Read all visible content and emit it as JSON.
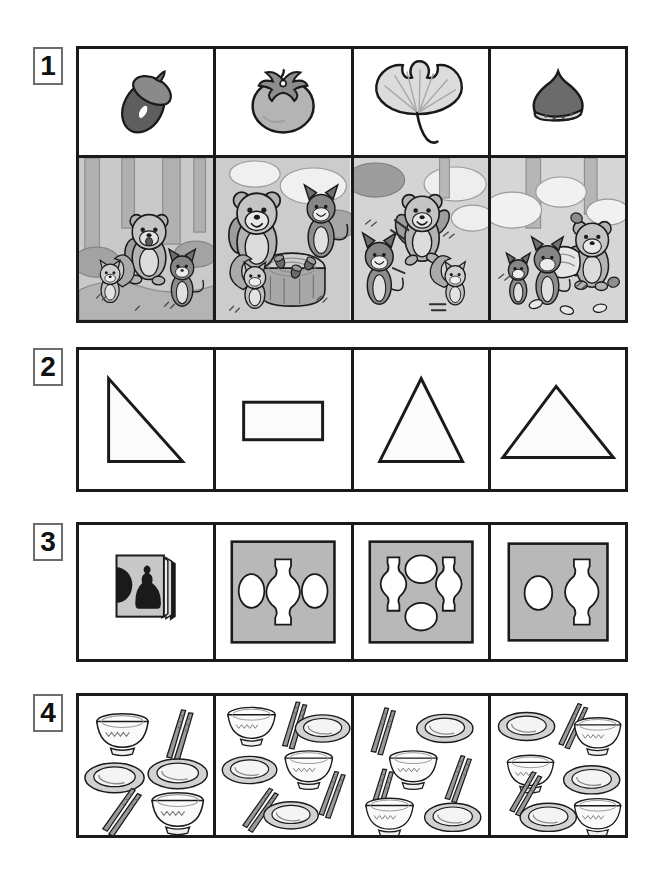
{
  "page": {
    "background": "#ffffff",
    "ink": "#1a1a1a",
    "gray_fill": "#b8b8b8",
    "light_fill": "#d8d8d8",
    "scene_bg": "#c9c9c9"
  },
  "rows": [
    {
      "number": "1",
      "name": "autumn-nature-and-forest-scenes",
      "top_cells": [
        {
          "name": "acorn",
          "label": "acorn",
          "icon": "acorn-icon"
        },
        {
          "name": "persimmon",
          "label": "persimmon",
          "icon": "persimmon-icon"
        },
        {
          "name": "ginkgo-leaf",
          "label": "ginkgo leaf",
          "icon": "ginkgo-leaf-icon"
        },
        {
          "name": "chestnut",
          "label": "chestnut",
          "icon": "chestnut-icon"
        }
      ],
      "bottom_cells": [
        {
          "name": "scene-walking-in-forest",
          "label": "bear, squirrel and cat walking in the forest",
          "animals": [
            "bear",
            "squirrel",
            "cat"
          ]
        },
        {
          "name": "scene-acorns-on-stump",
          "label": "bear, cat and squirrel around a tree stump with acorns",
          "animals": [
            "bear",
            "cat",
            "squirrel"
          ]
        },
        {
          "name": "scene-running-together",
          "label": "bear, cat and squirrel running",
          "animals": [
            "bear",
            "cat",
            "squirrel"
          ]
        },
        {
          "name": "scene-going-home",
          "label": "bear and cats heading home",
          "animals": [
            "cat",
            "cat",
            "bear"
          ]
        }
      ]
    },
    {
      "number": "2",
      "name": "shapes-row",
      "cells": [
        {
          "name": "right-triangle",
          "label": "right triangle",
          "shape": "right-triangle"
        },
        {
          "name": "rectangle",
          "label": "rectangle",
          "shape": "rectangle"
        },
        {
          "name": "tall-triangle",
          "label": "tall isosceles triangle",
          "shape": "tall-triangle"
        },
        {
          "name": "wide-triangle",
          "label": "wide isosceles triangle",
          "shape": "wide-triangle"
        }
      ]
    },
    {
      "number": "3",
      "name": "figure-ground-illusion-row",
      "cells": [
        {
          "name": "illusion-book",
          "label": "book showing face and vase illusion",
          "vases": 0,
          "faces": 0
        },
        {
          "name": "illusion-one-vase-two-faces",
          "label": "one vase between two faces",
          "vases": 1,
          "faces": 2
        },
        {
          "name": "illusion-two-vases-two-faces",
          "label": "two vases and two faces",
          "vases": 2,
          "faces": 2
        },
        {
          "name": "illusion-one-vase-one-face",
          "label": "one vase and one face",
          "vases": 1,
          "faces": 1
        }
      ]
    },
    {
      "number": "4",
      "name": "tableware-counting-row",
      "cells": [
        {
          "name": "tableware-set-a",
          "label": "tableware set A",
          "bowls": 2,
          "plates": 2,
          "chopsticks": 2
        },
        {
          "name": "tableware-set-b",
          "label": "tableware set B",
          "bowls": 2,
          "plates": 3,
          "chopsticks": 3
        },
        {
          "name": "tableware-set-c",
          "label": "tableware set C",
          "bowls": 2,
          "plates": 2,
          "chopsticks": 3
        },
        {
          "name": "tableware-set-d",
          "label": "tableware set D",
          "bowls": 3,
          "plates": 3,
          "chopsticks": 2
        }
      ]
    }
  ]
}
